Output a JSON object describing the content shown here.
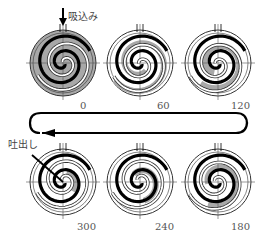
{
  "diagram": {
    "type": "scroll-compressor-cycle",
    "suction_label": "吸込み",
    "discharge_label": "吐出し",
    "colors": {
      "fixed_scroll": "#000000",
      "orbiting_scroll_fill": "#ffffff",
      "pocket_fill": "#a8a8a8",
      "outline": "#333333",
      "axis": "#555555"
    },
    "stages": [
      {
        "angle_label": "0",
        "row": 0,
        "col": 0,
        "rotation_deg": 0
      },
      {
        "angle_label": "60",
        "row": 0,
        "col": 1,
        "rotation_deg": 60
      },
      {
        "angle_label": "120",
        "row": 0,
        "col": 2,
        "rotation_deg": 120
      },
      {
        "angle_label": "180",
        "row": 1,
        "col": 2,
        "rotation_deg": 180
      },
      {
        "angle_label": "240",
        "row": 1,
        "col": 1,
        "rotation_deg": 240
      },
      {
        "angle_label": "300",
        "row": 1,
        "col": 0,
        "rotation_deg": 300
      }
    ],
    "flow_arrow": {
      "direction": "top-right to bottom-left, clockwise loop"
    }
  }
}
